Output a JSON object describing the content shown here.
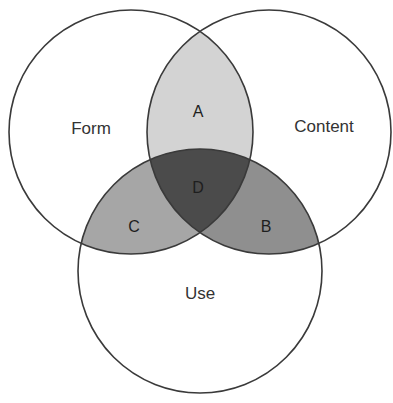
{
  "diagram": {
    "type": "venn",
    "sets": [
      {
        "id": "form",
        "label": "Form",
        "cx": 131,
        "cy": 132,
        "r": 122
      },
      {
        "id": "content",
        "label": "Content",
        "cx": 269,
        "cy": 132,
        "r": 122
      },
      {
        "id": "use",
        "label": "Use",
        "cx": 200,
        "cy": 271,
        "r": 122
      }
    ],
    "regions": [
      {
        "id": "A",
        "label": "A",
        "sets": [
          "form",
          "content"
        ],
        "fill": "#d3d3d3"
      },
      {
        "id": "B",
        "label": "B",
        "sets": [
          "content",
          "use"
        ],
        "fill": "#8f8f8f"
      },
      {
        "id": "C",
        "label": "C",
        "sets": [
          "form",
          "use"
        ],
        "fill": "#a6a6a6"
      },
      {
        "id": "D",
        "label": "D",
        "sets": [
          "form",
          "content",
          "use"
        ],
        "fill": "#4b4b4b"
      }
    ],
    "colors": {
      "outline": "#3a3a3a",
      "text": "#333333",
      "background": "#ffffff"
    }
  }
}
